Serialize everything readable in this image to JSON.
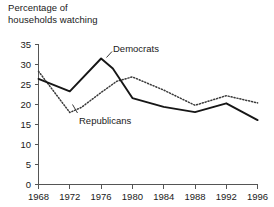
{
  "chart_data": {
    "type": "line",
    "title_line1": "Percentage of",
    "title_line2": "households watching",
    "xlabel": "",
    "ylabel": "Percentage of households watching",
    "xlim": [
      1968,
      1996
    ],
    "ylim": [
      0,
      35
    ],
    "ytick_step": 5,
    "grid": false,
    "legend_position": "inline-annotations",
    "categories": [
      1968,
      1972,
      1976,
      1980,
      1984,
      1988,
      1992,
      1996
    ],
    "xticklabels": [
      "1968",
      "1972",
      "1976",
      "1980",
      "1984",
      "1988",
      "1992",
      "1996"
    ],
    "yticklabels": [
      "0",
      "5",
      "10",
      "15",
      "20",
      "25",
      "30",
      "35"
    ],
    "series": [
      {
        "name": "Democrats",
        "style": "solid",
        "color": "#161616",
        "x": [
          1968,
          1972,
          1976,
          1977.5,
          1980,
          1984,
          1988,
          1992,
          1996
        ],
        "values": [
          26.4,
          23.3,
          31.5,
          29.0,
          21.6,
          19.4,
          18.1,
          20.3,
          16.1
        ]
      },
      {
        "name": "Republicans",
        "style": "dotted",
        "color": "#3a3a3a",
        "x": [
          1968,
          1972,
          1973.5,
          1976,
          1978,
          1980,
          1984,
          1988,
          1992,
          1996
        ],
        "values": [
          28.3,
          18.0,
          19.3,
          23.0,
          25.8,
          26.9,
          23.6,
          19.8,
          22.2,
          20.4
        ]
      }
    ],
    "annotations": [
      {
        "text": "Democrats",
        "x": 1978.2,
        "y": 33.6
      },
      {
        "text": "Republicans",
        "x": 1973.6,
        "y": 15.6
      }
    ]
  }
}
